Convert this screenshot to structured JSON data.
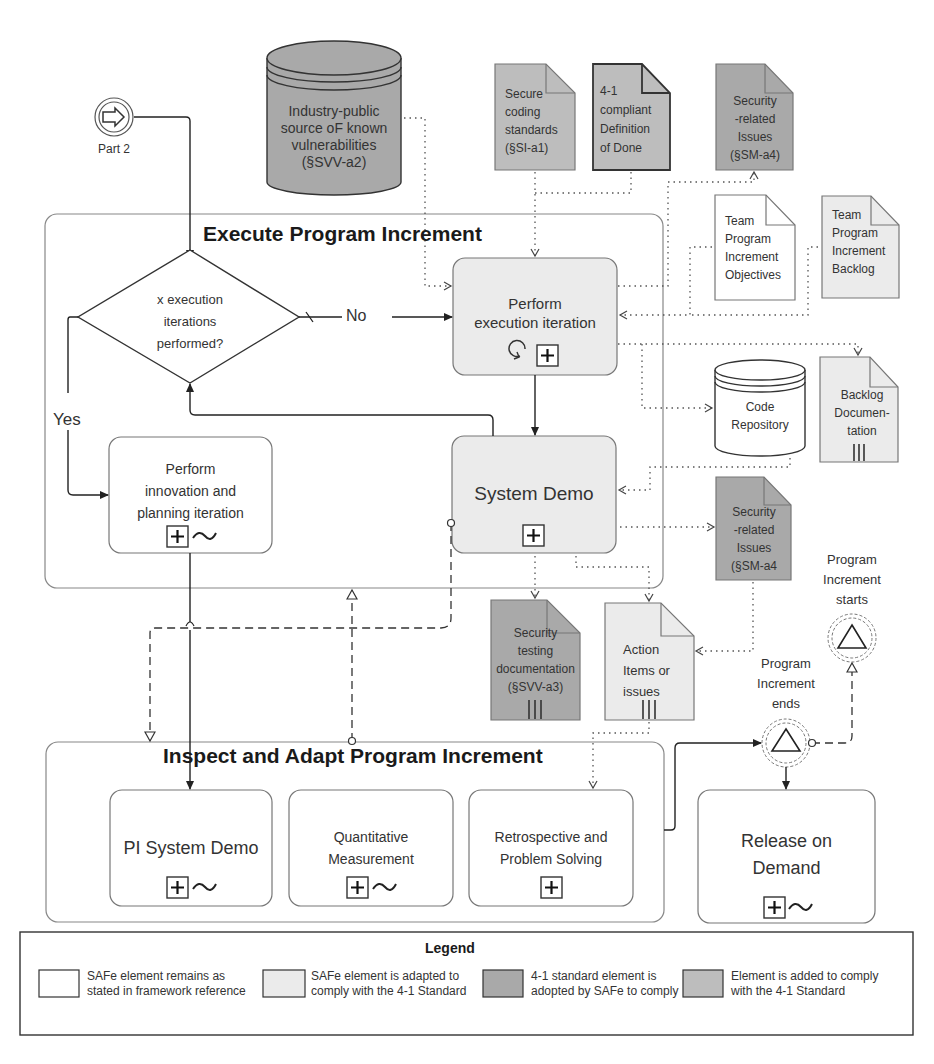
{
  "colors": {
    "white_fill": "#ffffff",
    "adapted_fill": "#ebebeb",
    "adopted_fill": "#a9a9a9",
    "added_fill": "#bdbdbd",
    "stroke": "#333333"
  },
  "start_event": {
    "label": "Part 2",
    "icon": "arrow-right-icon"
  },
  "data_stores": {
    "industry_source": {
      "lines": [
        "Industry-public",
        "source oF known",
        "vulnerabilities",
        "(§SVV-a2)"
      ]
    },
    "code_repository": {
      "lines": [
        "Code",
        "Repository"
      ]
    }
  },
  "documents": {
    "secure_coding": {
      "lines": [
        "Secure",
        "coding",
        "standards",
        "(§SI-a1)"
      ]
    },
    "definition_of_done": {
      "lines": [
        "4-1",
        "compliant",
        "Definition",
        "of Done"
      ]
    },
    "security_issues_top": {
      "lines": [
        "Security",
        "-related",
        "Issues",
        "(§SM-a4)"
      ]
    },
    "team_pi_objectives": {
      "lines": [
        "Team",
        "Program",
        "Increment",
        "Objectives"
      ]
    },
    "team_pi_backlog": {
      "lines": [
        "Team",
        "Program",
        "Increment",
        "Backlog"
      ]
    },
    "backlog_documentation": {
      "lines": [
        "Backlog",
        "Documen-",
        "tation"
      ]
    },
    "security_issues_mid": {
      "lines": [
        "Security",
        "-related",
        "Issues",
        "(§SM-a4"
      ]
    },
    "security_testing_doc": {
      "lines": [
        "Security",
        "testing",
        "documentation",
        "(§SVV-a3)"
      ]
    },
    "action_items": {
      "lines": [
        "Action",
        "Items or",
        "issues"
      ]
    }
  },
  "execute_pool": {
    "title": "Execute Program Increment",
    "gateway": {
      "lines": [
        "x execution",
        "iterations",
        "performed?"
      ]
    },
    "flow_no": "No",
    "flow_yes": "Yes",
    "tasks": {
      "perform_execution": {
        "lines": [
          "Perform",
          "execution iteration"
        ]
      },
      "system_demo": {
        "lines": [
          "System Demo"
        ]
      },
      "innovation_planning": {
        "lines": [
          "Perform",
          "innovation and",
          "planning iteration"
        ]
      }
    }
  },
  "inspect_pool": {
    "title": "Inspect and Adapt Program Increment",
    "tasks": {
      "pi_system_demo": {
        "lines": [
          "PI System Demo"
        ]
      },
      "quantitative_measurement": {
        "lines": [
          "Quantitative",
          "Measurement"
        ]
      },
      "retrospective": {
        "lines": [
          "Retrospective and",
          "Problem Solving"
        ]
      }
    }
  },
  "release_on_demand": {
    "lines": [
      "Release on",
      "Demand"
    ]
  },
  "events": {
    "pi_ends": {
      "lines": [
        "Program",
        "Increment",
        "ends"
      ]
    },
    "pi_starts": {
      "lines": [
        "Program",
        "Increment",
        "starts"
      ]
    }
  },
  "legend": {
    "title": "Legend",
    "items": [
      {
        "text": "SAFe element remains as stated in framework reference",
        "fill": "#ffffff"
      },
      {
        "text": "SAFe element is adapted to comply with the 4-1 Standard",
        "fill": "#ebebeb"
      },
      {
        "text": "4-1 standard element is adopted by SAFe to comply",
        "fill": "#a9a9a9"
      },
      {
        "text": "Element is added to comply with the 4-1 Standard",
        "fill": "#bdbdbd"
      }
    ]
  }
}
